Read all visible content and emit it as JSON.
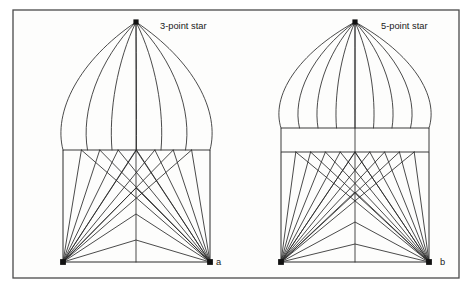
{
  "figure": {
    "background_color": "#ffffff",
    "panel_fill": "#fdfdfc",
    "line_color": "#2b2b2b",
    "frame_color": "#4a4a4a",
    "node_color": "#111111",
    "frame": {
      "x": 13,
      "y": 10,
      "width": 446,
      "height": 268
    }
  },
  "panels": [
    {
      "id": "a",
      "caption": "3-point star",
      "letter": "a",
      "caption_pos": {
        "x": 160,
        "y": 29
      },
      "letter_pos": {
        "x": 216,
        "y": 265
      },
      "apex": {
        "x": 136,
        "y": 22
      },
      "left_base": {
        "x": 63,
        "y": 262
      },
      "right_base": {
        "x": 210,
        "y": 262
      },
      "waist_y": 150,
      "meridian_count": 7,
      "lower_ray_count": 7,
      "chevron_count": 4,
      "chevron_apex_ys": [
        150,
        188,
        214,
        240
      ],
      "band": false
    },
    {
      "id": "b",
      "caption": "5-point star",
      "letter": "b",
      "caption_pos": {
        "x": 381,
        "y": 29
      },
      "letter_pos": {
        "x": 440,
        "y": 265
      },
      "apex": {
        "x": 355,
        "y": 22
      },
      "left_base": {
        "x": 281,
        "y": 262
      },
      "right_base": {
        "x": 429,
        "y": 262
      },
      "waist_y": 152,
      "band_top_y": 128,
      "band_bottom_y": 152,
      "meridian_count": 9,
      "lower_ray_count": 9,
      "chevron_count": 4,
      "chevron_apex_ys": [
        152,
        192,
        222,
        244
      ],
      "band": true
    }
  ],
  "chart_data": {
    "type": "diagram",
    "title": "",
    "panels": [
      {
        "label": "3-point star",
        "letter": "a",
        "meridians": 7,
        "lower_rays": 7,
        "chevrons": 4,
        "has_cylindrical_band": false
      },
      {
        "label": "5-point star",
        "letter": "b",
        "meridians": 9,
        "lower_rays": 9,
        "chevrons": 4,
        "has_cylindrical_band": true
      }
    ]
  }
}
